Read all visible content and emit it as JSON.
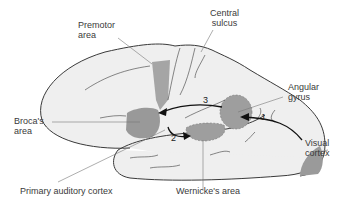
{
  "diagram": {
    "type": "brain-lateral-view",
    "labels": {
      "premotor": "Premotor\narea",
      "central_sulcus": "Central\nsulcus",
      "angular_gyrus": "Angular\ngyrus",
      "broca": "Broca's\narea",
      "visual_cortex": "Visual\ncortex",
      "primary_auditory": "Primary auditory cortex",
      "wernicke": "Wernicke's area"
    },
    "pathway_numbers": {
      "one": "1",
      "two": "2",
      "three": "3"
    },
    "colors": {
      "brain_fill": "#efefef",
      "region_fill": "#9a9a9a",
      "outline": "#3a3a3a",
      "leader_line": "#777777",
      "text": "#3a3a3a"
    }
  }
}
